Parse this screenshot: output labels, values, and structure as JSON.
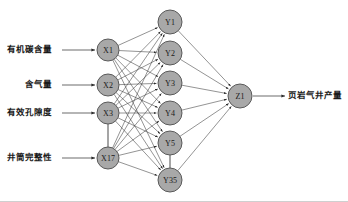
{
  "figure": {
    "type": "neural-network-diagram",
    "background_color": "#ffffff",
    "node_fill": "#a8a8a8",
    "node_stroke": "#5a5a5a",
    "edge_color": "#3a3a3a",
    "text_color": "#1a1a1a",
    "bottom_rule_color": "#cfcfcf"
  },
  "input_labels": [
    {
      "text": "有机碳含量",
      "x": 52,
      "y": 50
    },
    {
      "text": "含气量",
      "x": 52,
      "y": 85
    },
    {
      "text": "有效孔隙度",
      "x": 52,
      "y": 113
    },
    {
      "text": "井筒完整性",
      "x": 52,
      "y": 158
    }
  ],
  "output_labels": [
    {
      "text": "页岩气井产量",
      "x": 288,
      "y": 96
    }
  ],
  "layers": {
    "input": {
      "name": "input-layer",
      "x": 108,
      "radius": 11,
      "nodes": [
        {
          "id": "X1",
          "label": "X1",
          "cx": 108,
          "cy": 50
        },
        {
          "id": "X2",
          "label": "X2",
          "cx": 108,
          "cy": 85
        },
        {
          "id": "X3",
          "label": "X3",
          "cx": 108,
          "cy": 113
        },
        {
          "id": "X17",
          "label": "X17",
          "cx": 108,
          "cy": 158
        }
      ],
      "ellipsis_connector": {
        "from": "X3",
        "to": "X17"
      }
    },
    "hidden": {
      "name": "hidden-layer",
      "x": 170,
      "radius": 12,
      "nodes": [
        {
          "id": "Y1",
          "label": "Y1",
          "cx": 170,
          "cy": 22
        },
        {
          "id": "Y2",
          "label": "Y2",
          "cx": 170,
          "cy": 53
        },
        {
          "id": "Y3",
          "label": "Y3",
          "cx": 170,
          "cy": 83
        },
        {
          "id": "Y4",
          "label": "Y4",
          "cx": 170,
          "cy": 113
        },
        {
          "id": "Y5",
          "label": "Y5",
          "cx": 170,
          "cy": 143
        },
        {
          "id": "Y35",
          "label": "Y35",
          "cx": 170,
          "cy": 180
        }
      ],
      "ellipsis_connector": {
        "from": "Y5",
        "to": "Y35"
      }
    },
    "output": {
      "name": "output-layer",
      "x": 240,
      "radius": 12,
      "nodes": [
        {
          "id": "Z1",
          "label": "Z1",
          "cx": 240,
          "cy": 96
        }
      ]
    }
  },
  "input_arrows": [
    {
      "x1": 62,
      "y1": 50,
      "x2": 95,
      "y2": 50
    },
    {
      "x1": 62,
      "y1": 85,
      "x2": 95,
      "y2": 85
    },
    {
      "x1": 62,
      "y1": 113,
      "x2": 95,
      "y2": 113
    },
    {
      "x1": 62,
      "y1": 158,
      "x2": 95,
      "y2": 158
    }
  ],
  "output_arrow": {
    "x1": 253,
    "y1": 96,
    "x2": 285,
    "y2": 96
  }
}
